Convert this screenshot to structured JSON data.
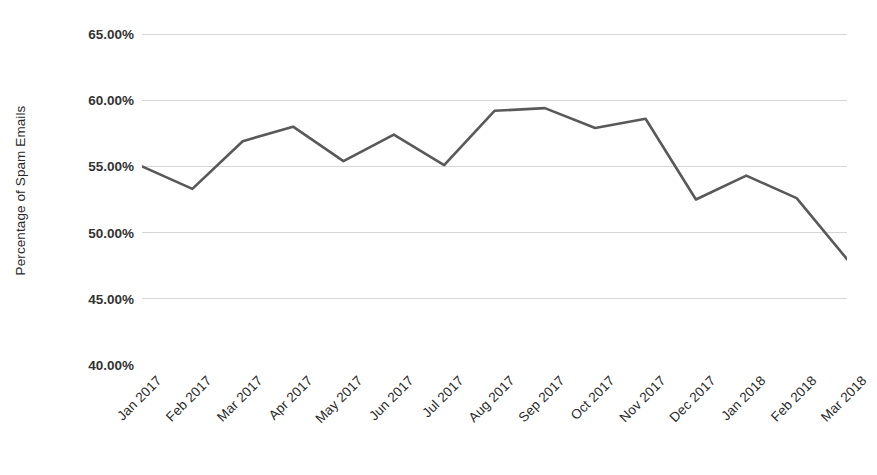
{
  "chart_data": {
    "type": "line",
    "title": "",
    "xlabel": "",
    "ylabel": "Percentage of Spam Emails",
    "categories": [
      "Jan 2017",
      "Feb 2017",
      "Mar 2017",
      "Apr 2017",
      "May 2017",
      "Jun 2017",
      "Jul 2017",
      "Aug 2017",
      "Sep 2017",
      "Oct 2017",
      "Nov 2017",
      "Dec 2017",
      "Jan 2018",
      "Feb 2018",
      "Mar 2018"
    ],
    "values": [
      55.0,
      53.3,
      56.9,
      58.0,
      55.4,
      57.4,
      55.1,
      59.2,
      59.4,
      57.9,
      58.6,
      52.5,
      54.3,
      52.6,
      48.0
    ],
    "ylim": [
      40.0,
      65.0
    ],
    "y_ticks": [
      65.0,
      60.0,
      55.0,
      50.0,
      45.0,
      40.0
    ],
    "y_tick_labels": [
      "65.00%",
      "60.00%",
      "55.00%",
      "50.00%",
      "45.00%",
      "40.00%"
    ],
    "value_suffix": "%",
    "grid": true,
    "grid_axis": "y",
    "legend": false,
    "legend_position": "none",
    "markers": false,
    "series": [
      {
        "name": "Percentage of Spam Emails",
        "values": [
          55.0,
          53.3,
          56.9,
          58.0,
          55.4,
          57.4,
          55.1,
          59.2,
          59.4,
          57.9,
          58.6,
          52.5,
          54.3,
          52.6,
          48.0
        ]
      }
    ]
  },
  "style": {
    "line_color": "#595959",
    "line_width": 2.6,
    "grid_color": "#d6d6d6",
    "axis_color": "#d6d6d6",
    "tick_text_color": "#333333",
    "label_text_color": "#2b2b2b",
    "background": "#ffffff",
    "x_label_rotation_deg": -45
  }
}
